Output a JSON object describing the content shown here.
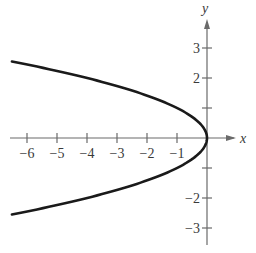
{
  "chart_data": {
    "type": "line",
    "title": "",
    "equation": "x = -y^2",
    "xlabel": "x",
    "ylabel": "y",
    "xlim": [
      -6.9,
      1.2
    ],
    "ylim": [
      -3.6,
      4.3
    ],
    "grid": false,
    "legend": null,
    "xticks": [
      -6,
      -5,
      -4,
      -3,
      -2,
      -1
    ],
    "xtick_labels": [
      "−6",
      "−5",
      "−4",
      "−3",
      "−2",
      "−1"
    ],
    "yticks": [
      -3,
      -2,
      -1,
      1,
      2,
      3
    ],
    "ytick_labels": [
      "−3",
      "−2",
      "",
      "",
      "2",
      "3"
    ],
    "series": [
      {
        "name": "parabola",
        "parametric": "x = -y^2",
        "y_range": [
          -2.55,
          2.55
        ],
        "points": [
          {
            "x": -6.5,
            "y": -2.55
          },
          {
            "x": -4,
            "y": -2
          },
          {
            "x": -2.25,
            "y": -1.5
          },
          {
            "x": -1,
            "y": -1
          },
          {
            "x": -0.25,
            "y": -0.5
          },
          {
            "x": 0,
            "y": 0
          },
          {
            "x": -0.25,
            "y": 0.5
          },
          {
            "x": -1,
            "y": 1
          },
          {
            "x": -2.25,
            "y": 1.5
          },
          {
            "x": -4,
            "y": 2
          },
          {
            "x": -6.5,
            "y": 2.55
          }
        ]
      }
    ]
  },
  "layout": {
    "origin_px": [
      207,
      138
    ],
    "unit_px": 30,
    "axis_color": "#6a6a6a",
    "curve_color": "#1a1a1a"
  }
}
